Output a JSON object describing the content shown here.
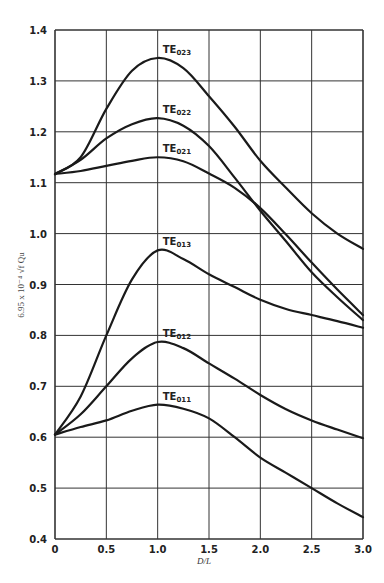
{
  "chart_data": {
    "type": "line",
    "title": "",
    "xlabel": "D/L",
    "ylabel": "6.95 x 10⁻⁴ √f Qu",
    "xlim": [
      0,
      3.0
    ],
    "ylim": [
      0.4,
      1.4
    ],
    "grid": true,
    "xticks": [
      0,
      0.5,
      1.0,
      1.5,
      2.0,
      2.5,
      3.0
    ],
    "xtick_labels": [
      "0",
      "0.5",
      "1.0",
      "1.5",
      "2.0",
      "2.5",
      "3.0"
    ],
    "yticks": [
      0.4,
      0.5,
      0.6,
      0.7,
      0.8,
      0.9,
      1.0,
      1.1,
      1.2,
      1.3,
      1.4
    ],
    "ytick_labels": [
      "0.4",
      "0.5",
      "0.6",
      "0.7",
      "0.8",
      "0.9",
      "1.0",
      "1.1",
      "1.2",
      "1.3",
      "1.4"
    ],
    "x": [
      0,
      0.25,
      0.5,
      0.75,
      1.0,
      1.25,
      1.5,
      1.75,
      2.0,
      2.25,
      2.5,
      2.75,
      3.0
    ],
    "series": [
      {
        "name": "TE023",
        "label_main": "TE",
        "label_sub": "023",
        "label_at": [
          1.05,
          1.355
        ],
        "values": [
          1.117,
          1.15,
          1.245,
          1.32,
          1.345,
          1.325,
          1.27,
          1.21,
          1.143,
          1.09,
          1.04,
          1.0,
          0.97
        ]
      },
      {
        "name": "TE022",
        "label_main": "TE",
        "label_sub": "022",
        "label_at": [
          1.05,
          1.237
        ],
        "values": [
          1.117,
          1.145,
          1.187,
          1.215,
          1.227,
          1.212,
          1.172,
          1.11,
          1.045,
          0.985,
          0.924,
          0.875,
          0.83
        ]
      },
      {
        "name": "TE021",
        "label_main": "TE",
        "label_sub": "021",
        "label_at": [
          1.05,
          1.16
        ],
        "values": [
          1.117,
          1.123,
          1.133,
          1.143,
          1.15,
          1.142,
          1.118,
          1.09,
          1.05,
          0.998,
          0.943,
          0.89,
          0.84
        ]
      },
      {
        "name": "TE013",
        "label_main": "TE",
        "label_sub": "013",
        "label_at": [
          1.05,
          0.977
        ],
        "values": [
          0.605,
          0.68,
          0.8,
          0.91,
          0.967,
          0.95,
          0.92,
          0.895,
          0.87,
          0.852,
          0.84,
          0.828,
          0.815
        ]
      },
      {
        "name": "TE012",
        "label_main": "TE",
        "label_sub": "012",
        "label_at": [
          1.05,
          0.797
        ],
        "values": [
          0.605,
          0.645,
          0.7,
          0.755,
          0.787,
          0.775,
          0.745,
          0.715,
          0.683,
          0.655,
          0.633,
          0.615,
          0.598
        ]
      },
      {
        "name": "TE011",
        "label_main": "TE",
        "label_sub": "011",
        "label_at": [
          1.05,
          0.674
        ],
        "values": [
          0.605,
          0.62,
          0.633,
          0.652,
          0.664,
          0.656,
          0.637,
          0.6,
          0.56,
          0.53,
          0.5,
          0.47,
          0.443
        ]
      }
    ],
    "legend": "none (inline curve labels near peaks)"
  }
}
